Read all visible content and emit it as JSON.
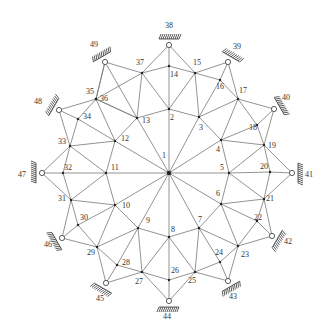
{
  "diagram": {
    "type": "truss-network",
    "colors": {
      "member": "#777777",
      "node": "#222222",
      "support": "#333333",
      "label": "#333333"
    },
    "center": [
      169,
      173
    ],
    "nodes": {
      "1": [
        169,
        173
      ],
      "2": [
        169,
        109
      ],
      "3": [
        199,
        117
      ],
      "4": [
        221,
        140
      ],
      "5": [
        229,
        173
      ],
      "6": [
        221,
        204
      ],
      "7": [
        199,
        228
      ],
      "8": [
        169,
        237
      ],
      "9": [
        138,
        228
      ],
      "10": [
        115,
        205
      ],
      "11": [
        106,
        173
      ],
      "12": [
        115,
        141
      ],
      "13": [
        137,
        118
      ],
      "14": [
        169,
        66
      ],
      "15": [
        195,
        73
      ],
      "16": [
        220,
        80
      ],
      "17": [
        238,
        99
      ],
      "18": [
        257,
        125
      ],
      "19": [
        264,
        145
      ],
      "20": [
        270,
        172
      ],
      "21": [
        264,
        199
      ],
      "22": [
        257,
        221
      ],
      "23": [
        238,
        246
      ],
      "24": [
        220,
        262
      ],
      "25": [
        195,
        272
      ],
      "26": [
        169,
        280
      ],
      "27": [
        142,
        272
      ],
      "28": [
        117,
        265
      ],
      "29": [
        97,
        247
      ],
      "30": [
        78,
        225
      ],
      "31": [
        71,
        200
      ],
      "32": [
        63,
        173
      ],
      "33": [
        70,
        146
      ],
      "34": [
        78,
        119
      ],
      "35": [
        96,
        99
      ],
      "36": [
        96,
        99
      ],
      "37": [
        142,
        73
      ],
      "38": [
        169,
        45
      ],
      "39": [
        228,
        62
      ],
      "40": [
        274,
        109
      ],
      "41": [
        292,
        173
      ],
      "42": [
        272,
        236
      ],
      "43": [
        228,
        281
      ],
      "44": [
        169,
        301
      ],
      "45": [
        106,
        283
      ],
      "46": [
        62,
        238
      ],
      "47": [
        42,
        173
      ],
      "48": [
        59,
        110
      ],
      "49": [
        105,
        62
      ]
    },
    "supports": [
      {
        "id": "38",
        "angle": -90
      },
      {
        "id": "39",
        "angle": -60
      },
      {
        "id": "40",
        "angle": -30
      },
      {
        "id": "41",
        "angle": 0
      },
      {
        "id": "42",
        "angle": 30
      },
      {
        "id": "43",
        "angle": 60
      },
      {
        "id": "44",
        "angle": 90
      },
      {
        "id": "45",
        "angle": 120
      },
      {
        "id": "46",
        "angle": 150
      },
      {
        "id": "47",
        "angle": 180
      },
      {
        "id": "48",
        "angle": 210
      },
      {
        "id": "49",
        "angle": 240
      }
    ],
    "members": [
      [
        1,
        2
      ],
      [
        1,
        3
      ],
      [
        1,
        4
      ],
      [
        1,
        5
      ],
      [
        1,
        6
      ],
      [
        1,
        7
      ],
      [
        1,
        8
      ],
      [
        1,
        9
      ],
      [
        1,
        10
      ],
      [
        1,
        11
      ],
      [
        1,
        12
      ],
      [
        1,
        13
      ],
      [
        2,
        3
      ],
      [
        3,
        4
      ],
      [
        4,
        5
      ],
      [
        5,
        6
      ],
      [
        6,
        7
      ],
      [
        7,
        8
      ],
      [
        8,
        9
      ],
      [
        9,
        10
      ],
      [
        10,
        11
      ],
      [
        11,
        12
      ],
      [
        12,
        13
      ],
      [
        13,
        2
      ],
      [
        2,
        14
      ],
      [
        14,
        38
      ],
      [
        38,
        15
      ],
      [
        38,
        37
      ],
      [
        14,
        37
      ],
      [
        14,
        15
      ],
      [
        2,
        15
      ],
      [
        2,
        37
      ],
      [
        13,
        37
      ],
      [
        3,
        15
      ],
      [
        15,
        16
      ],
      [
        16,
        39
      ],
      [
        15,
        39
      ],
      [
        39,
        17
      ],
      [
        16,
        17
      ],
      [
        3,
        16
      ],
      [
        3,
        17
      ],
      [
        4,
        17
      ],
      [
        17,
        40
      ],
      [
        17,
        18
      ],
      [
        18,
        40
      ],
      [
        40,
        19
      ],
      [
        18,
        19
      ],
      [
        4,
        18
      ],
      [
        4,
        19
      ],
      [
        5,
        19
      ],
      [
        19,
        20
      ],
      [
        20,
        41
      ],
      [
        19,
        41
      ],
      [
        41,
        21
      ],
      [
        20,
        21
      ],
      [
        5,
        20
      ],
      [
        5,
        21
      ],
      [
        6,
        21
      ],
      [
        21,
        22
      ],
      [
        22,
        42
      ],
      [
        21,
        42
      ],
      [
        42,
        23
      ],
      [
        22,
        23
      ],
      [
        6,
        22
      ],
      [
        6,
        23
      ],
      [
        7,
        23
      ],
      [
        23,
        24
      ],
      [
        24,
        43
      ],
      [
        23,
        43
      ],
      [
        43,
        25
      ],
      [
        24,
        25
      ],
      [
        7,
        24
      ],
      [
        7,
        25
      ],
      [
        8,
        25
      ],
      [
        25,
        26
      ],
      [
        26,
        44
      ],
      [
        25,
        44
      ],
      [
        44,
        27
      ],
      [
        26,
        27
      ],
      [
        8,
        26
      ],
      [
        8,
        27
      ],
      [
        9,
        27
      ],
      [
        27,
        28
      ],
      [
        28,
        45
      ],
      [
        27,
        45
      ],
      [
        45,
        29
      ],
      [
        28,
        29
      ],
      [
        9,
        28
      ],
      [
        9,
        29
      ],
      [
        10,
        29
      ],
      [
        29,
        30
      ],
      [
        30,
        46
      ],
      [
        29,
        46
      ],
      [
        46,
        31
      ],
      [
        30,
        31
      ],
      [
        10,
        30
      ],
      [
        10,
        31
      ],
      [
        11,
        31
      ],
      [
        31,
        32
      ],
      [
        32,
        47
      ],
      [
        31,
        47
      ],
      [
        47,
        33
      ],
      [
        32,
        33
      ],
      [
        11,
        32
      ],
      [
        11,
        33
      ],
      [
        12,
        33
      ],
      [
        33,
        34
      ],
      [
        34,
        48
      ],
      [
        33,
        48
      ],
      [
        48,
        35
      ],
      [
        34,
        35
      ],
      [
        12,
        34
      ],
      [
        12,
        35
      ],
      [
        13,
        35
      ],
      [
        35,
        36
      ],
      [
        36,
        49
      ],
      [
        35,
        49
      ],
      [
        49,
        37
      ],
      [
        36,
        37
      ],
      [
        13,
        36
      ],
      [
        13,
        49
      ]
    ],
    "labels": [
      {
        "t": "1",
        "x": 162,
        "y": 158
      },
      {
        "t": "2",
        "x": 170,
        "y": 120
      },
      {
        "t": "3",
        "x": 199,
        "y": 130
      },
      {
        "t": "4",
        "x": 216,
        "y": 152
      },
      {
        "t": "5",
        "x": 220,
        "y": 170
      },
      {
        "t": "6",
        "x": 216,
        "y": 196
      },
      {
        "t": "7",
        "x": 198,
        "y": 222
      },
      {
        "t": "8",
        "x": 171,
        "y": 232
      },
      {
        "t": "9",
        "x": 146,
        "y": 223
      },
      {
        "t": "10",
        "x": 122,
        "y": 208
      },
      {
        "t": "11",
        "x": 111,
        "y": 170
      },
      {
        "t": "12",
        "x": 121,
        "y": 141
      },
      {
        "t": "13",
        "x": 142,
        "y": 123
      },
      {
        "t": "14",
        "x": 170,
        "y": 77
      },
      {
        "t": "15",
        "x": 193,
        "y": 65
      },
      {
        "t": "16",
        "x": 216,
        "y": 89
      },
      {
        "t": "17",
        "x": 239,
        "y": 93
      },
      {
        "t": "18",
        "x": 249,
        "y": 130
      },
      {
        "t": "19",
        "x": 268,
        "y": 148
      },
      {
        "t": "20",
        "x": 260,
        "y": 169
      },
      {
        "t": "21",
        "x": 266,
        "y": 201
      },
      {
        "t": "22",
        "x": 254,
        "y": 220
      },
      {
        "t": "23",
        "x": 241,
        "y": 257
      },
      {
        "t": "24",
        "x": 215,
        "y": 255
      },
      {
        "t": "25",
        "x": 188,
        "y": 283
      },
      {
        "t": "26",
        "x": 171,
        "y": 273
      },
      {
        "t": "27",
        "x": 135,
        "y": 284
      },
      {
        "t": "28",
        "x": 122,
        "y": 265
      },
      {
        "t": "29",
        "x": 87,
        "y": 255
      },
      {
        "t": "30",
        "x": 80,
        "y": 220
      },
      {
        "t": "31",
        "x": 58,
        "y": 201
      },
      {
        "t": "32",
        "x": 64,
        "y": 170
      },
      {
        "t": "33",
        "x": 58,
        "y": 144
      },
      {
        "t": "34",
        "x": 83,
        "y": 119
      },
      {
        "t": "35",
        "x": 86,
        "y": 94
      },
      {
        "t": "36",
        "x": 100,
        "y": 101
      },
      {
        "t": "37",
        "x": 136,
        "y": 65
      },
      {
        "t": "38",
        "x": 165,
        "y": 28
      },
      {
        "t": "39",
        "x": 233,
        "y": 49
      },
      {
        "t": "40",
        "x": 282,
        "y": 100
      },
      {
        "t": "41",
        "x": 305,
        "y": 177
      },
      {
        "t": "42",
        "x": 284,
        "y": 244
      },
      {
        "t": "43",
        "x": 229,
        "y": 299
      },
      {
        "t": "44",
        "x": 163,
        "y": 319
      },
      {
        "t": "45",
        "x": 96,
        "y": 301
      },
      {
        "t": "46",
        "x": 44,
        "y": 247
      },
      {
        "t": "47",
        "x": 18,
        "y": 177
      },
      {
        "t": "48",
        "x": 34,
        "y": 104
      },
      {
        "t": "49",
        "x": 90,
        "y": 47
      }
    ]
  }
}
